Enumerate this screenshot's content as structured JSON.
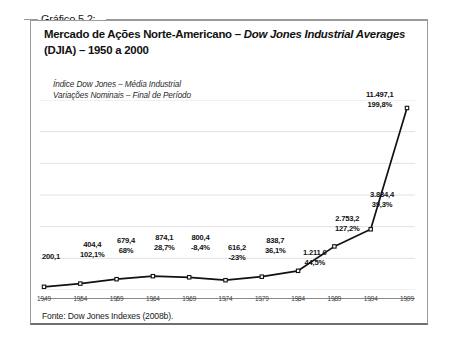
{
  "figure": {
    "caption_label": "Gráfico 5.2:",
    "title_line1_plain": "Mercado de Ações Norte-Americano – ",
    "title_line1_italic": "Dow Jones Industrial Averages",
    "title_line2": "(DJIA) – 1950 a 2000",
    "subtitle_line1": "Índice Dow Jones – Média Industrial",
    "subtitle_line2": "Variações Nominais – Final de Período",
    "source": "Fonte: Dow Jones Indexes (2008b)."
  },
  "colors": {
    "line": "#111111",
    "marker_fill": "#ffffff",
    "marker_stroke": "#111111",
    "gridline": "#d9d9d9",
    "axis": "#8a8a8a",
    "frame": "#9a9a9a"
  },
  "chart_data": {
    "type": "line",
    "title": "Mercado de Ações Norte-Americano – Dow Jones Industrial Averages (DJIA) – 1950 a 2000",
    "subtitle": "Índice Dow Jones – Média Industrial / Variações Nominais – Final de Período",
    "xlabel": "",
    "ylabel": "",
    "grid": true,
    "legend": "none",
    "xlim": [
      1949,
      1999
    ],
    "ylim": [
      0,
      12000
    ],
    "xtick_labels": [
      "1949",
      "1954",
      "1959",
      "1964",
      "1969",
      "1974",
      "1979",
      "1984",
      "1989",
      "1994",
      "1999"
    ],
    "x": [
      1949,
      1954,
      1959,
      1964,
      1969,
      1974,
      1979,
      1984,
      1989,
      1994,
      1999
    ],
    "values": [
      200.1,
      404.4,
      679.4,
      874.1,
      800.4,
      616.2,
      838.7,
      1211.6,
      2753.2,
      3834.4,
      11497.1
    ],
    "value_labels": [
      "200,1",
      "404,4",
      "679,4",
      "874,1",
      "800,4",
      "616,2",
      "838,7",
      "1.211,6",
      "2.753,2",
      "3.834,4",
      "11.497,1"
    ],
    "pct_labels": [
      "",
      "102,1%",
      "68%",
      "28,7%",
      "-8,4%",
      "-23%",
      "36,1%",
      "44,5%",
      "127,2%",
      "39,3%",
      "199,8%"
    ],
    "series_name": "DJIA – Final de Período"
  },
  "annotations": [
    {
      "value": "200,1",
      "pct": "",
      "x": 2,
      "y": 152
    },
    {
      "value": "404,4",
      "pct": "102,1%",
      "x": 40,
      "y": 140
    },
    {
      "value": "679,4",
      "pct": "68%",
      "x": 77,
      "y": 136
    },
    {
      "value": "874,1",
      "pct": "28,7%",
      "x": 114,
      "y": 133
    },
    {
      "value": "800,4",
      "pct": "-8,4%",
      "x": 151,
      "y": 133
    },
    {
      "value": "616,2",
      "pct": "-23%",
      "x": 188,
      "y": 143
    },
    {
      "value": "838,7",
      "pct": "36,1%",
      "x": 225,
      "y": 136
    },
    {
      "value": "1.211,6",
      "pct": "44,5%",
      "x": 263,
      "y": 148
    },
    {
      "value": "2.753,2",
      "pct": "127,2%",
      "x": 295,
      "y": 114
    },
    {
      "value": "3.834,4",
      "pct": "39,3%",
      "x": 330,
      "y": 90
    },
    {
      "value": "11.497,1",
      "pct": "199,8%",
      "x": 326,
      "y": -10
    }
  ]
}
